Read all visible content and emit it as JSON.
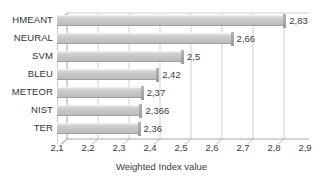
{
  "chart_data": {
    "type": "bar",
    "orientation": "horizontal",
    "title": "",
    "xlabel": "Weighted Index value",
    "ylabel": "",
    "xlim": [
      2.1,
      2.9
    ],
    "xticks": [
      "2,1",
      "2,2",
      "2,3",
      "2,4",
      "2,5",
      "2,6",
      "2,7",
      "2,8",
      "2,9"
    ],
    "xtick_values": [
      2.1,
      2.2,
      2.3,
      2.4,
      2.5,
      2.6,
      2.7,
      2.8,
      2.9
    ],
    "grid": true,
    "legend": false,
    "decimal_separator": ",",
    "categories": [
      "HMEANT",
      "NEURAL",
      "SVM",
      "BLEU",
      "METEOR",
      "NIST",
      "TER"
    ],
    "values": [
      2.83,
      2.66,
      2.5,
      2.42,
      2.37,
      2.366,
      2.36
    ],
    "labels": [
      "2,83",
      "2,66",
      "2,5",
      "2,42",
      "2,37",
      "2,366",
      "2,36"
    ],
    "bar_color": "#c4c4c4",
    "bar_edge_color": "#9f9f9f",
    "text_color": "#3b3b3b",
    "background": "#ffffff"
  }
}
